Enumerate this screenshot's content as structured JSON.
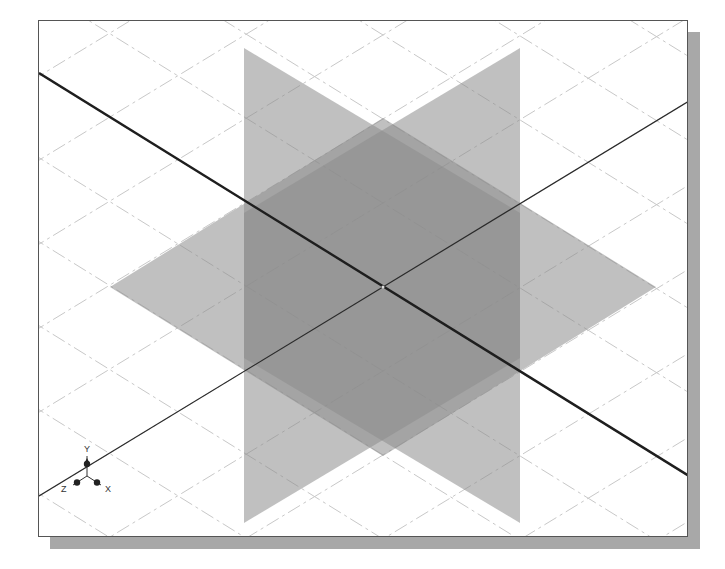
{
  "scene": {
    "description": "Isometric view of three datum planes with grid and axes",
    "colors": {
      "background": "#ffffff",
      "grid": "#c8c8c8",
      "plane_fill": "#8c8c8c",
      "axis_thick": "#1e1e1e",
      "axis_thin": "#2a2a2a",
      "frame": "#555555",
      "shadow": "#a8a8a8"
    },
    "planes": [
      {
        "name": "vertical-plane-1",
        "points": "205,27 481,192 481,502 205,337",
        "opacity": 0.55
      },
      {
        "name": "vertical-plane-2",
        "points": "481,27 205,192 205,502 481,337",
        "opacity": 0.55
      },
      {
        "name": "horizontal-plane",
        "points": "71,266 344,97 617,266 344,435",
        "opacity": 0.55
      }
    ],
    "axes": [
      {
        "name": "axis-thick",
        "x1": 0,
        "y1": 52,
        "x2": 650,
        "y2": 455,
        "width": 2.4
      },
      {
        "name": "axis-thin",
        "x1": 0,
        "y1": 475,
        "x2": 650,
        "y2": 80,
        "width": 1.2
      }
    ],
    "origin": {
      "x": 344,
      "y": 266
    }
  },
  "triad": {
    "x_label": "X",
    "y_label": "Y",
    "z_label": "Z"
  }
}
